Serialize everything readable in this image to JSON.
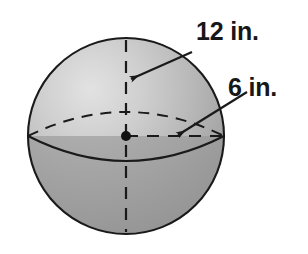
{
  "figure": {
    "name": "sphere-with-dimensions",
    "background_color": "#ffffff"
  },
  "sphere": {
    "center_x": 126,
    "center_y": 136,
    "radius_px": 98,
    "outline_color": "#1a1a1a",
    "fill_light": "#d8d8d8",
    "fill_mid": "#b4b4b4",
    "fill_dark": "#9a9a9a",
    "lower_half_color": "#a6a6a6"
  },
  "labels": {
    "diameter": {
      "text": "12 in.",
      "x": 196,
      "y": 40,
      "color": "#17171a"
    },
    "radius": {
      "text": "6 in.",
      "x": 228,
      "y": 96,
      "color": "#17171a"
    }
  },
  "arrows": {
    "diameter_arrow": {
      "name": "diameter-leader-arrow",
      "tail_x": 192,
      "tail_y": 52,
      "head_x": 129,
      "head_y": 80,
      "color": "#1a1a1a"
    },
    "radius_arrow": {
      "name": "radius-leader-arrow",
      "tail_x": 247,
      "tail_y": 92,
      "head_x": 176,
      "head_y": 136,
      "color": "#1a1a1a"
    }
  },
  "guides": {
    "vertical_diameter": {
      "name": "vertical-dashed-diameter",
      "x": 126,
      "y_top": 40,
      "y_bottom": 232,
      "style": "dashed",
      "color": "#1a1a1a"
    },
    "horizontal_radius": {
      "name": "horizontal-dashed-radius",
      "y": 136,
      "x_start": 126,
      "x_end": 224,
      "style": "dashed",
      "color": "#1a1a1a"
    },
    "equator_back_arc": {
      "name": "equator-back-dashed-arc",
      "style": "dashed",
      "color": "#1a1a1a",
      "peak_y": 112
    },
    "equator_front_arc": {
      "name": "equator-front-solid-arc",
      "style": "solid",
      "color": "#1a1a1a",
      "sag_y": 161
    },
    "center_point": {
      "name": "center-point-dot",
      "x": 126,
      "y": 136,
      "radius_px": 5,
      "color": "#111111"
    }
  }
}
